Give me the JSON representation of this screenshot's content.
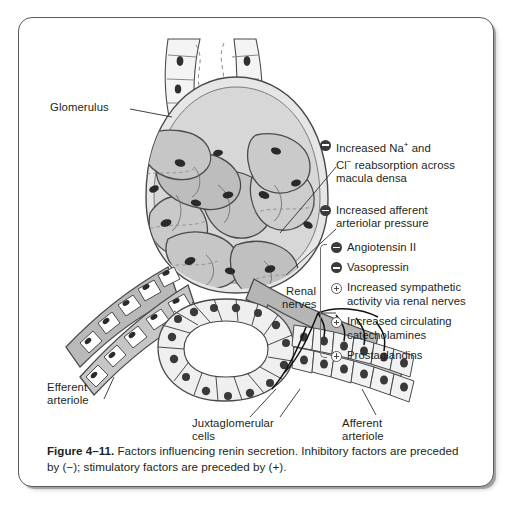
{
  "figure": {
    "number_label": "Figure 4–11.",
    "caption_text": " Factors influencing renin secretion. Inhibitory factors are preceded by (−); stimulatory factors are preceded by (+)."
  },
  "anatomy_labels": {
    "glomerulus": "Glomerulus",
    "efferent_arteriole_line1": "Efferent",
    "efferent_arteriole_line2": "arteriole",
    "juxtaglomerular_line1": "Juxtaglomerular",
    "juxtaglomerular_line2": "cells",
    "afferent_arteriole_line1": "Afferent",
    "afferent_arteriole_line2": "arteriole",
    "renal_nerves_line1": "Renal",
    "renal_nerves_line2": "nerves"
  },
  "factors": {
    "ungrouped": [
      {
        "sign": "minus",
        "line1": "Increased Na",
        "sup1": "+",
        "mid": " and",
        "line2": "Cl",
        "sup2": "−",
        "line2b": " reabsorption across",
        "line3": "macula densa"
      },
      {
        "sign": "minus",
        "line1": "Increased afferent",
        "line2": "arteriolar pressure"
      }
    ],
    "grouped": [
      {
        "sign": "minus",
        "line1": "Angiotensin II"
      },
      {
        "sign": "minus",
        "line1": "Vasopressin"
      },
      {
        "sign": "plus",
        "line1": "Increased sympathetic",
        "line2": "activity via renal nerves"
      },
      {
        "sign": "plus",
        "line1": "Increased circulating",
        "line2": "catecholamines"
      },
      {
        "sign": "plus",
        "line1": "Prostaglandins"
      }
    ]
  },
  "colors": {
    "ink": "#231f20",
    "frame": "#595959",
    "tissue_light": "#e9e9e9",
    "tissue_mid": "#cfcfcf",
    "tissue_dark": "#a8a8a8",
    "nucleus": "#3a3a3a",
    "outline": "#4a4a4a"
  }
}
